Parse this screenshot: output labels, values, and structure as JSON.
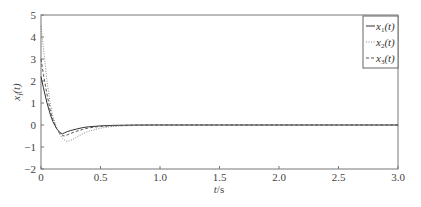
{
  "chart_data": {
    "type": "line",
    "title": "",
    "xlabel": "t/s",
    "ylabel": "x_i(t)",
    "xlim": [
      0,
      3.0
    ],
    "ylim": [
      -2,
      5
    ],
    "xticks": [
      "0",
      "0.5",
      "1.0",
      "1.5",
      "2.0",
      "2.5",
      "3.0"
    ],
    "yticks": [
      "-2",
      "-1",
      "0",
      "1",
      "2",
      "3",
      "4",
      "5"
    ],
    "grid": false,
    "legend_position": "upper right",
    "x": [
      0,
      0.02,
      0.05,
      0.08,
      0.1,
      0.13,
      0.16,
      0.18,
      0.2,
      0.22,
      0.25,
      0.3,
      0.35,
      0.4,
      0.5,
      0.6,
      0.7,
      0.8,
      1.0,
      1.5,
      2.0,
      2.5,
      3.0
    ],
    "series": [
      {
        "name": "x1(t)",
        "style": "solid",
        "values": [
          2.2,
          1.7,
          1.0,
          0.45,
          0.15,
          -0.15,
          -0.35,
          -0.4,
          -0.35,
          -0.3,
          -0.25,
          -0.18,
          -0.12,
          -0.08,
          -0.04,
          -0.02,
          -0.01,
          0,
          0,
          0,
          0,
          0,
          0
        ]
      },
      {
        "name": "x2(t)",
        "style": "dotted",
        "values": [
          4.5,
          3.5,
          2.0,
          0.9,
          0.4,
          -0.1,
          -0.45,
          -0.6,
          -0.7,
          -0.75,
          -0.7,
          -0.55,
          -0.4,
          -0.28,
          -0.14,
          -0.07,
          -0.04,
          -0.02,
          0,
          0,
          0,
          0,
          0
        ]
      },
      {
        "name": "x3(t)",
        "style": "dashed",
        "values": [
          3.0,
          2.3,
          1.4,
          0.6,
          0.25,
          -0.15,
          -0.4,
          -0.48,
          -0.5,
          -0.45,
          -0.38,
          -0.28,
          -0.2,
          -0.13,
          -0.06,
          -0.03,
          -0.02,
          -0.01,
          0,
          0,
          0,
          0,
          0
        ]
      }
    ]
  },
  "legend": {
    "items": [
      {
        "base": "x",
        "sub": "1",
        "rest": "(t)"
      },
      {
        "base": "x",
        "sub": "2",
        "rest": "(t)"
      },
      {
        "base": "x",
        "sub": "3",
        "rest": "(t)"
      }
    ]
  },
  "axes": {
    "xlabel_base": "t",
    "xlabel_rest": "/s",
    "ylabel_base": "x",
    "ylabel_sub": "i",
    "ylabel_rest": "(t)"
  }
}
